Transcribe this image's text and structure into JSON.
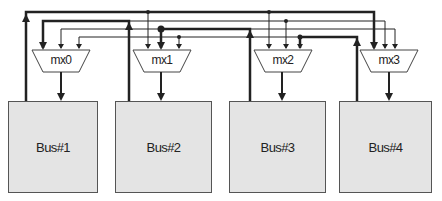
{
  "diagram": {
    "type": "bus-multiplexer-interconnect",
    "colors": {
      "line": "#222222",
      "bus_fill": "#e4e4e4",
      "bus_border": "#555555",
      "mux_fill": "#ffffff"
    },
    "buses": [
      {
        "id": "bus1",
        "label": "Bus#1"
      },
      {
        "id": "bus2",
        "label": "Bus#2"
      },
      {
        "id": "bus3",
        "label": "Bus#3"
      },
      {
        "id": "bus4",
        "label": "Bus#4"
      }
    ],
    "muxes": [
      {
        "id": "mx0",
        "label": "mx0",
        "output_to": "Bus#1",
        "inputs_from": [
          "Bus#2",
          "Bus#3",
          "Bus#4"
        ]
      },
      {
        "id": "mx1",
        "label": "mx1",
        "output_to": "Bus#2",
        "inputs_from": [
          "Bus#1",
          "Bus#3",
          "Bus#4"
        ]
      },
      {
        "id": "mx2",
        "label": "mx2",
        "output_to": "Bus#3",
        "inputs_from": [
          "Bus#1",
          "Bus#2",
          "Bus#4"
        ]
      },
      {
        "id": "mx3",
        "label": "mx3",
        "output_to": "Bus#4",
        "inputs_from": [
          "Bus#1",
          "Bus#2",
          "Bus#3"
        ]
      }
    ]
  }
}
